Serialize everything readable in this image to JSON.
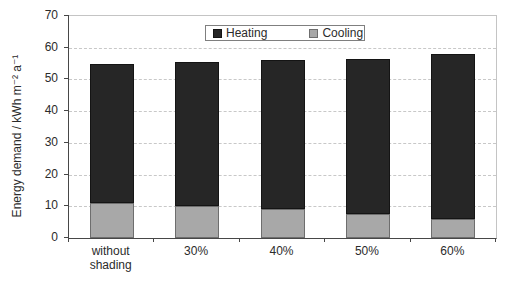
{
  "chart_data": {
    "type": "bar",
    "stacked": true,
    "title": "",
    "categories": [
      "without shading",
      "30%",
      "40%",
      "50%",
      "60%"
    ],
    "series": [
      {
        "name": "Heating",
        "color": "#262626",
        "border_color": "#141414",
        "values": [
          44,
          45.5,
          47,
          49,
          52
        ]
      },
      {
        "name": "Cooling",
        "color": "#a8a8a8",
        "border_color": "#6e6e6e",
        "values": [
          11,
          10,
          9,
          7.5,
          6
        ]
      }
    ],
    "stack_order_bottom_to_top": [
      "Cooling",
      "Heating"
    ],
    "xlabel": "",
    "ylabel": "Energy demand / kWh m⁻² a⁻¹",
    "ylim": [
      0,
      70
    ],
    "yticks": [
      0,
      10,
      20,
      30,
      40,
      50,
      60,
      70
    ],
    "grid": true,
    "gridline_style": "dashed",
    "legend_position": "top-center",
    "colors": {
      "axis": "#474747",
      "gridline": "#c8c8c8",
      "plot_border_light": "#c4c4c4",
      "text": "#2b2b2b",
      "background": "#ffffff"
    }
  }
}
